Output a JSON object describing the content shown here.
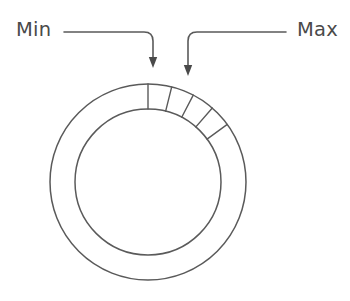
{
  "diagram": {
    "background_color": "#ffffff",
    "stroke_color": "#5a5a5a",
    "arrow_fill_color": "#4a4a4a"
  },
  "labels": {
    "min": "Min",
    "max": "Max"
  },
  "ring": {
    "center_x": 148,
    "center_y": 182,
    "outer_radius": 98,
    "inner_radius": 73,
    "shape": "annulus"
  },
  "ticks": {
    "count": 5,
    "unit": "degrees_clockwise_from_top",
    "angles": [
      0,
      14,
      27.5,
      41,
      54
    ]
  },
  "annotations": [
    {
      "name": "min-annotation",
      "label": "Min",
      "label_x": 16,
      "label_y": 36,
      "line_start_x": 64,
      "line_start_y": 32,
      "corner_x": 153,
      "corner_y": 32,
      "arrow_tip_x": 153,
      "arrow_tip_y": 68,
      "points_to_tick_index": 0
    },
    {
      "name": "max-annotation",
      "label": "Max",
      "label_x": 338,
      "label_y": 36,
      "line_start_x": 286,
      "line_start_y": 32,
      "corner_x": 188,
      "corner_y": 32,
      "arrow_tip_x": 188,
      "arrow_tip_y": 76,
      "points_to_tick_index": 1
    }
  ]
}
